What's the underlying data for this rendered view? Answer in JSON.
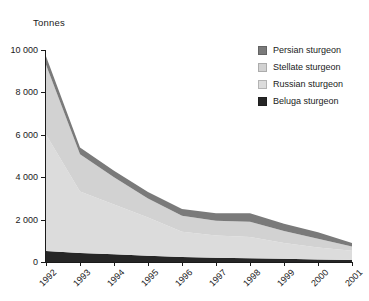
{
  "chart_data": {
    "type": "area",
    "stacked": true,
    "title": "",
    "xlabel": "",
    "ylabel": "Tonnes",
    "ylim": [
      0,
      10000
    ],
    "yticks": [
      0,
      2000,
      4000,
      6000,
      8000,
      10000
    ],
    "ytick_labels": [
      "0",
      "2 000",
      "4 000",
      "6 000",
      "8 000",
      "10 000"
    ],
    "grid": false,
    "legend_position": "top-right",
    "categories": [
      "1992",
      "1993",
      "1994",
      "1995",
      "1996",
      "1997",
      "1998",
      "1999",
      "2000",
      "2001"
    ],
    "series": [
      {
        "name": "Beluga sturgeon",
        "color": "#262626",
        "values": [
          520,
          430,
          360,
          300,
          230,
          200,
          180,
          150,
          120,
          100
        ]
      },
      {
        "name": "Russian sturgeon",
        "color": "#dcdcdc",
        "values": [
          5500,
          2900,
          2350,
          1800,
          1200,
          1050,
          1000,
          750,
          560,
          430
        ]
      },
      {
        "name": "Stellate sturgeon",
        "color": "#d2d2d2",
        "values": [
          3280,
          1750,
          1290,
          900,
          750,
          700,
          720,
          560,
          420,
          200
        ]
      },
      {
        "name": "Persian sturgeon",
        "color": "#7a7a7a",
        "values": [
          400,
          320,
          300,
          300,
          320,
          350,
          400,
          340,
          300,
          170
        ]
      }
    ],
    "totals": [
      9700,
      5400,
      4300,
      3300,
      2500,
      2300,
      2300,
      1800,
      1400,
      900
    ]
  },
  "legend": {
    "items": [
      {
        "label": "Persian sturgeon",
        "color": "#7a7a7a"
      },
      {
        "label": "Stellate sturgeon",
        "color": "#d2d2d2"
      },
      {
        "label": "Russian sturgeon",
        "color": "#dcdcdc"
      },
      {
        "label": "Beluga sturgeon",
        "color": "#262626"
      }
    ]
  },
  "axes": {
    "y_title": "Tonnes",
    "y_labels": [
      "10 000",
      "8 000",
      "6 000",
      "4 000",
      "2 000",
      "0"
    ],
    "x_labels": [
      "1992",
      "1993",
      "1994",
      "1995",
      "1996",
      "1997",
      "1998",
      "1999",
      "2000",
      "2001"
    ]
  }
}
